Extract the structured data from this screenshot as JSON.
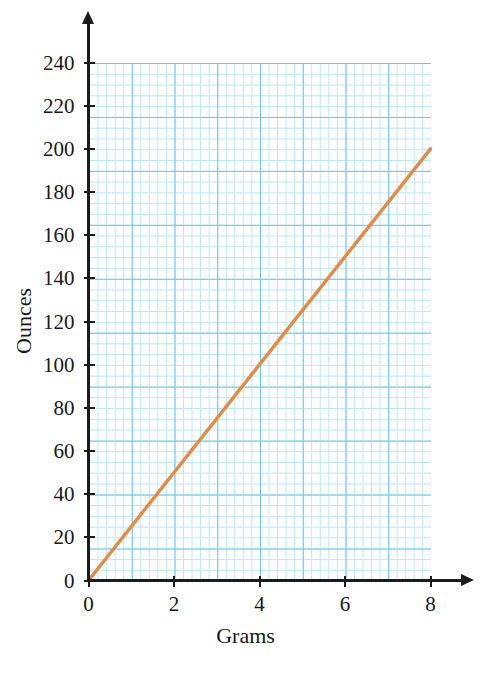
{
  "chart_data": {
    "type": "line",
    "title": "",
    "xlabel": "Grams",
    "ylabel": "Ounces",
    "xlim": [
      0,
      8
    ],
    "ylim": [
      0,
      240
    ],
    "xticks": [
      0,
      2,
      4,
      6,
      8
    ],
    "yticks": [
      0,
      20,
      40,
      60,
      80,
      100,
      120,
      140,
      160,
      180,
      200,
      220,
      240
    ],
    "xtick_labels": [
      "0",
      "2",
      "4",
      "6",
      "8"
    ],
    "ytick_labels": [
      "0",
      "20",
      "40",
      "60",
      "80",
      "100",
      "120",
      "140",
      "160",
      "180",
      "200",
      "220",
      "240"
    ],
    "grid": true,
    "grid_style": "graph-paper",
    "grid_minor_step_x": 0.2,
    "grid_minor_step_y": 5,
    "grid_major_step_x": 1,
    "grid_major_step_y": 25,
    "legend": null,
    "series": [
      {
        "name": "grams-to-ounces",
        "type": "line",
        "color": "#e08b47",
        "x": [
          0,
          8
        ],
        "y": [
          0,
          200
        ],
        "slope": 25,
        "intercept": 0,
        "points": [
          {
            "x": 0,
            "y": 0
          },
          {
            "x": 1,
            "y": 25
          },
          {
            "x": 2,
            "y": 50
          },
          {
            "x": 3,
            "y": 75
          },
          {
            "x": 4,
            "y": 100
          },
          {
            "x": 5,
            "y": 125
          },
          {
            "x": 6,
            "y": 150
          },
          {
            "x": 7,
            "y": 175
          },
          {
            "x": 8,
            "y": 200
          }
        ]
      }
    ],
    "annotations": []
  },
  "colors": {
    "line": "#e08b47",
    "axis": "#1b1b1b",
    "grid_minor": "#bfe6f5",
    "grid_major": "#6fc6e8",
    "paper": "#fdfeff",
    "text": "#181818"
  },
  "axes": {
    "x_arrow": "arrow-right-icon",
    "y_arrow": "arrow-up-icon"
  }
}
